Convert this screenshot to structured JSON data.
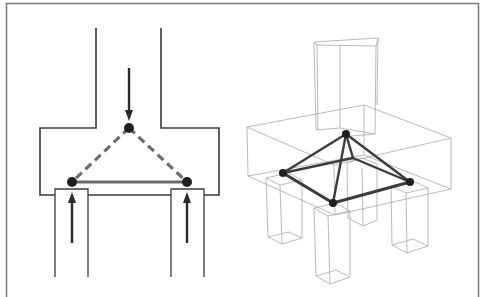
{
  "figure": {
    "colors": {
      "background": "#ffffff",
      "frame": "#7a7a7a",
      "outline": "#3a3a3a",
      "wireframe": "#a8a8a8",
      "strut": "#6e6e6e",
      "tie": "#6a6a6a",
      "node": "#1e1e1e",
      "arrow": "#2a2a2a",
      "truss_3d": "#3c3c3c"
    },
    "left_panel": {
      "name": "2D section",
      "nodes": [
        "top-node",
        "bottom-left-node",
        "bottom-right-node"
      ],
      "struts": [
        "left-strut",
        "right-strut"
      ],
      "ties": [
        "bottom-tie"
      ],
      "loads": [
        "column-load-arrow",
        "left-pile-reaction-arrow",
        "right-pile-reaction-arrow"
      ]
    },
    "right_panel": {
      "name": "3D wireframe",
      "nodes": [
        "apex-node",
        "left-node",
        "front-node",
        "right-node"
      ],
      "members": [
        "apex-left",
        "apex-front",
        "apex-right",
        "apex-back",
        "left-front",
        "front-right",
        "left-right-back"
      ]
    }
  }
}
